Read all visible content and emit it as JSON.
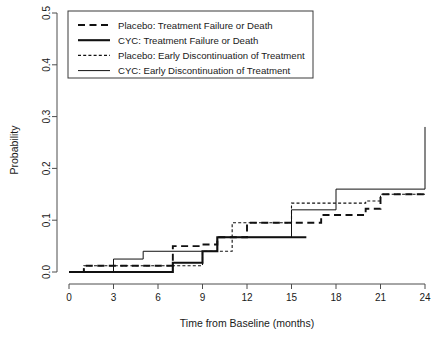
{
  "chart_data": {
    "type": "line",
    "title": "",
    "xlabel": "Time from Baseline (months)",
    "ylabel": "Probability",
    "xlim": [
      -0.6,
      24.6
    ],
    "ylim": [
      0.0,
      0.5
    ],
    "xticks": [
      "0",
      "3",
      "6",
      "9",
      "12",
      "15",
      "18",
      "21",
      "24"
    ],
    "xtick_values": [
      0,
      3,
      6,
      9,
      12,
      15,
      18,
      21,
      24
    ],
    "yticks": [
      "0.0",
      "0.1",
      "0.2",
      "0.3",
      "0.4",
      "0.5"
    ],
    "ytick_values": [
      0.0,
      0.1,
      0.2,
      0.3,
      0.4,
      0.5
    ],
    "grid": false,
    "legend_position": "top-left",
    "step_type": "post",
    "series": [
      {
        "name": "Placebo: Treatment Failure or Death",
        "style": "dashed-thick",
        "color": "#111111",
        "x": [
          0,
          1,
          4,
          7,
          9,
          10,
          12,
          16,
          17,
          20,
          21,
          24
        ],
        "y": [
          0.0,
          0.012,
          0.012,
          0.05,
          0.053,
          0.067,
          0.095,
          0.095,
          0.11,
          0.122,
          0.15,
          0.15
        ]
      },
      {
        "name": "CYC: Treatment Failure or Death",
        "style": "solid-thick",
        "color": "#111111",
        "x": [
          0,
          6,
          7,
          9,
          10,
          12,
          16
        ],
        "y": [
          0.0,
          0.0,
          0.018,
          0.04,
          0.067,
          0.067,
          0.067
        ]
      },
      {
        "name": "Placebo: Early Discontinuation of Treatment",
        "style": "dotted-thin",
        "color": "#111111",
        "x": [
          0,
          1,
          7,
          9,
          11,
          12,
          15,
          18,
          20,
          21,
          24
        ],
        "y": [
          0.0,
          0.012,
          0.012,
          0.04,
          0.095,
          0.095,
          0.133,
          0.133,
          0.137,
          0.15,
          0.15
        ]
      },
      {
        "name": "CYC: Early Discontinuation of Treatment",
        "style": "solid-thin",
        "color": "#111111",
        "x": [
          0,
          3,
          5,
          9,
          10,
          12,
          15,
          18,
          24,
          24
        ],
        "y": [
          0.0,
          0.025,
          0.04,
          0.04,
          0.067,
          0.067,
          0.12,
          0.16,
          0.16,
          0.28
        ]
      }
    ]
  },
  "legend": {
    "entries": [
      {
        "label": "Placebo: Treatment Failure or Death",
        "style": "dashed-thick"
      },
      {
        "label": "CYC: Treatment Failure or Death",
        "style": "solid-thick"
      },
      {
        "label": "Placebo: Early Discontinuation of Treatment",
        "style": "dotted-thin"
      },
      {
        "label": "CYC: Early Discontinuation of Treatment",
        "style": "solid-thin"
      }
    ]
  }
}
